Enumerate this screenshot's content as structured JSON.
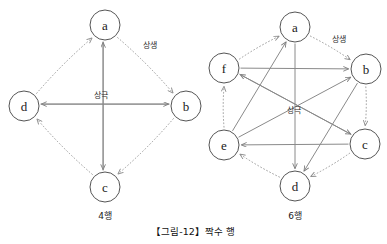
{
  "figure": {
    "caption": "【그림-12】짝수 행",
    "panels": [
      {
        "id": "panel-4",
        "caption": "4행",
        "node_count": 4,
        "center": {
          "x": 105,
          "y": 106
        },
        "radius": 81,
        "node_radius": 15,
        "nodes": [
          {
            "id": "a",
            "label": "a",
            "x": 105,
            "y": 25
          },
          {
            "id": "b",
            "label": "b",
            "x": 186,
            "y": 106
          },
          {
            "id": "c",
            "label": "c",
            "x": 105,
            "y": 187
          },
          {
            "id": "d",
            "label": "d",
            "x": 24,
            "y": 106
          }
        ],
        "edge_labels": [
          {
            "id": "sangsaeng",
            "text": "상생",
            "x": 150,
            "y": 45
          },
          {
            "id": "sanggeuk",
            "text": "상극",
            "x": 101,
            "y": 95
          }
        ],
        "generative_edges": [
          {
            "from": "a",
            "to": "b"
          },
          {
            "from": "b",
            "to": "c"
          },
          {
            "from": "c",
            "to": "d"
          },
          {
            "from": "d",
            "to": "a"
          }
        ],
        "controlling_edges": [
          {
            "from": "a",
            "to": "c"
          },
          {
            "from": "c",
            "to": "a"
          },
          {
            "from": "b",
            "to": "d"
          },
          {
            "from": "d",
            "to": "b"
          }
        ]
      },
      {
        "id": "panel-6",
        "caption": "6행",
        "node_count": 6,
        "center": {
          "x": 295,
          "y": 106
        },
        "radius": 82,
        "node_radius": 15,
        "nodes": [
          {
            "id": "a",
            "label": "a",
            "x": 295,
            "y": 27
          },
          {
            "id": "b",
            "label": "b",
            "x": 366,
            "y": 69
          },
          {
            "id": "c",
            "label": "c",
            "x": 365,
            "y": 144
          },
          {
            "id": "d",
            "label": "d",
            "x": 295,
            "y": 186
          },
          {
            "id": "e",
            "label": "e",
            "x": 224,
            "y": 145
          },
          {
            "id": "f",
            "label": "f",
            "x": 224,
            "y": 68
          }
        ],
        "edge_labels": [
          {
            "id": "sangsaeng",
            "text": "상생",
            "x": 339,
            "y": 39
          },
          {
            "id": "sanggeuk",
            "text": "상극",
            "x": 294,
            "y": 110
          }
        ],
        "generative_edges": [
          {
            "from": "a",
            "to": "b"
          },
          {
            "from": "b",
            "to": "c"
          },
          {
            "from": "c",
            "to": "d"
          },
          {
            "from": "d",
            "to": "e"
          },
          {
            "from": "e",
            "to": "f"
          },
          {
            "from": "f",
            "to": "a"
          }
        ],
        "controlling_edges": [
          {
            "from": "f",
            "to": "b"
          },
          {
            "from": "c",
            "to": "e"
          },
          {
            "from": "e",
            "to": "a"
          },
          {
            "from": "a",
            "to": "d"
          },
          {
            "from": "b",
            "to": "d"
          },
          {
            "from": "c",
            "to": "f"
          },
          {
            "from": "e",
            "to": "b"
          },
          {
            "from": "f",
            "to": "c"
          }
        ]
      }
    ],
    "legend_terms": {
      "generative": "상생",
      "controlling": "상극"
    }
  }
}
